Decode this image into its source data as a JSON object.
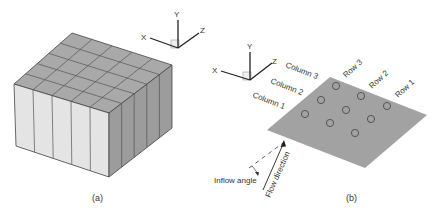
{
  "panel_a": {
    "caption": "(a)",
    "axes": {
      "x": "X",
      "y": "Y",
      "z": "Z"
    },
    "grid": {
      "columns": 5,
      "rows": 5
    }
  },
  "panel_b": {
    "caption": "(b)",
    "axes": {
      "x": "X",
      "y": "Y",
      "z": "Z"
    },
    "column_labels": [
      "Column 1",
      "Column 2",
      "Column 3"
    ],
    "row_labels": [
      "Row 1",
      "Row 2",
      "Row 3"
    ],
    "inflow_label": "Inflow angle",
    "flow_label": "Flow direction"
  },
  "colors": {
    "top_face": "#a9a9a9",
    "front_face": "#e4e4e4",
    "side_face": "#9c9c9c",
    "plate": "#a2a2a2",
    "line": "#444444",
    "text": "#333333"
  }
}
